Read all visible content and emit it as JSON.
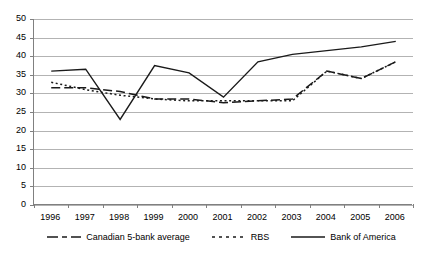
{
  "chart_data": {
    "type": "line",
    "title": "",
    "xlabel": "",
    "ylabel": "",
    "categories": [
      "1996",
      "1997",
      "1998",
      "1999",
      "2000",
      "2001",
      "2002",
      "2003",
      "2004",
      "2005",
      "2006"
    ],
    "x": [
      1996,
      1997,
      1998,
      1999,
      2000,
      2001,
      2002,
      2003,
      2004,
      2005,
      2006
    ],
    "ylim": [
      0,
      50
    ],
    "yticks": [
      0,
      5,
      10,
      15,
      20,
      25,
      30,
      35,
      40,
      45,
      50
    ],
    "grid": true,
    "legend_position": "bottom",
    "series": [
      {
        "name": "Canadian 5-bank average",
        "style": "dashed",
        "color": "#1a1a1a",
        "values": [
          31.5,
          31.5,
          30.5,
          28.5,
          28.5,
          27.5,
          28,
          28.5,
          36,
          34,
          38.5
        ]
      },
      {
        "name": "RBS",
        "style": "dotted",
        "color": "#1a1a1a",
        "values": [
          33,
          31,
          29.5,
          28.5,
          28,
          28,
          28,
          28,
          36,
          34,
          38.5
        ]
      },
      {
        "name": "Bank of America",
        "style": "solid",
        "color": "#1a1a1a",
        "values": [
          36,
          36.5,
          23,
          37.5,
          35.5,
          29,
          38.5,
          40.5,
          41.5,
          42.5,
          44
        ]
      }
    ]
  },
  "axis": {
    "y_tick_labels": [
      "0",
      "5",
      "10",
      "15",
      "20",
      "25",
      "30",
      "35",
      "40",
      "45",
      "50"
    ],
    "x_tick_labels": [
      "1996",
      "1997",
      "1998",
      "1999",
      "2000",
      "2001",
      "2002",
      "2003",
      "2004",
      "2005",
      "2006"
    ]
  },
  "legend": {
    "entries": [
      {
        "label": "Canadian 5-bank average",
        "icon": "dashed-line-swatch"
      },
      {
        "label": "RBS",
        "icon": "dotted-line-swatch"
      },
      {
        "label": "Bank of America",
        "icon": "solid-line-swatch"
      }
    ]
  },
  "colors": {
    "axis": "#808080",
    "grid": "#b3b3b3",
    "line": "#1a1a1a",
    "background": "#ffffff"
  }
}
